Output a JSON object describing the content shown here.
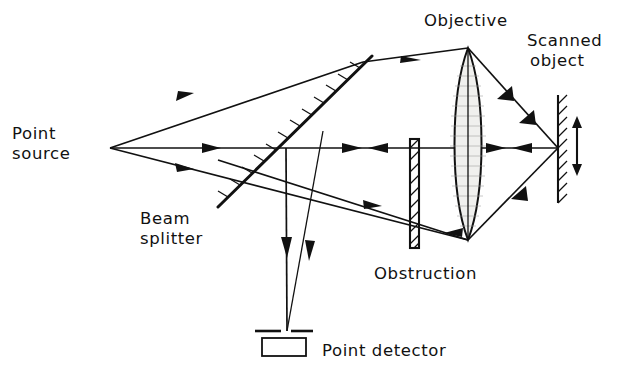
{
  "figure": {
    "background_color": "#ffffff",
    "ink_color": "#111111",
    "width": 621,
    "height": 367
  },
  "labels": {
    "point_source": "Point\nsource",
    "point_source_line1": "Point",
    "point_source_line2": "source",
    "beam_splitter_line1": "Beam",
    "beam_splitter_line2": "splitter",
    "objective": "Objective",
    "scanned_object_line1": "Scanned",
    "scanned_object_line2": "object",
    "obstruction": "Obstruction",
    "point_detector": "Point detector"
  },
  "components": [
    {
      "name": "point-source",
      "label": "Point source",
      "type": "source-point",
      "x": 110,
      "y": 148
    },
    {
      "name": "beam-splitter",
      "label": "Beam splitter",
      "type": "partially-reflecting-plate",
      "x1": 218,
      "y1": 207,
      "x2": 372,
      "y2": 56,
      "hatch_side": "upper-left"
    },
    {
      "name": "obstruction",
      "label": "Obstruction",
      "type": "opaque-bar",
      "x": 414,
      "y_top": 139,
      "y_bottom": 248,
      "width": 9
    },
    {
      "name": "objective",
      "label": "Objective",
      "type": "biconvex-lens",
      "x": 468,
      "y_top": 48,
      "y_bottom": 240,
      "half_width": 17
    },
    {
      "name": "scanned-object",
      "label": "Scanned object",
      "type": "hatched-surface",
      "x": 558,
      "y_top": 95,
      "y_bottom": 203,
      "hatch_side": "right",
      "scan_arrow": {
        "x": 577,
        "y_top": 120,
        "y_bottom": 172,
        "direction": "double-vertical"
      }
    },
    {
      "name": "point-detector",
      "label": "Point detector",
      "type": "detector-with-pinhole",
      "pinhole_y": 331,
      "pinhole_left_x1": 255,
      "pinhole_left_x2": 281,
      "pinhole_right_x1": 291,
      "pinhole_right_x2": 313,
      "box_x": 262,
      "box_y": 338,
      "box_w": 44,
      "box_h": 18
    }
  ],
  "rays": {
    "illumination": "Diverging cone from point source transmits through beam splitter, is collimated/refracted by objective, and focuses onto the scanned object",
    "detection": "Light returning from the scanned object passes back through the objective and reflects off the beam splitter down to the point detector"
  },
  "label_positions": {
    "point_source": {
      "x": 12,
      "y": 139
    },
    "beam_splitter": {
      "x": 140,
      "y": 218
    },
    "objective": {
      "x": 424,
      "y": 24
    },
    "scanned_object": {
      "x": 528,
      "y": 44
    },
    "obstruction": {
      "x": 374,
      "y": 277
    },
    "point_detector": {
      "x": 322,
      "y": 355
    }
  }
}
